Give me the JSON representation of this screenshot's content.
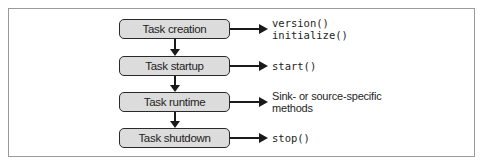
{
  "diagram": {
    "stages": [
      {
        "label": "Task creation",
        "methods": [
          "version()",
          "initialize()"
        ],
        "method_style": "code"
      },
      {
        "label": "Task startup",
        "methods": [
          "start()"
        ],
        "method_style": "code"
      },
      {
        "label": "Task runtime",
        "methods": [
          "Sink- or source-specific",
          "methods"
        ],
        "method_style": "text"
      },
      {
        "label": "Task shutdown",
        "methods": [
          "stop()"
        ],
        "method_style": "code"
      }
    ],
    "colors": {
      "box_fill": "#dcdcdc",
      "box_border": "#2a2a2a",
      "arrow": "#1a1a1a",
      "frame_border": "#9a9a9a"
    }
  }
}
